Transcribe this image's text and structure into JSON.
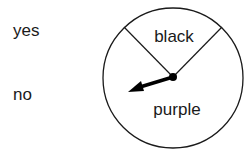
{
  "options": {
    "yes": "yes",
    "no": "no"
  },
  "spinner": {
    "sections": [
      {
        "label": "black"
      },
      {
        "label": "purple"
      }
    ],
    "pointer_direction": "purple"
  }
}
